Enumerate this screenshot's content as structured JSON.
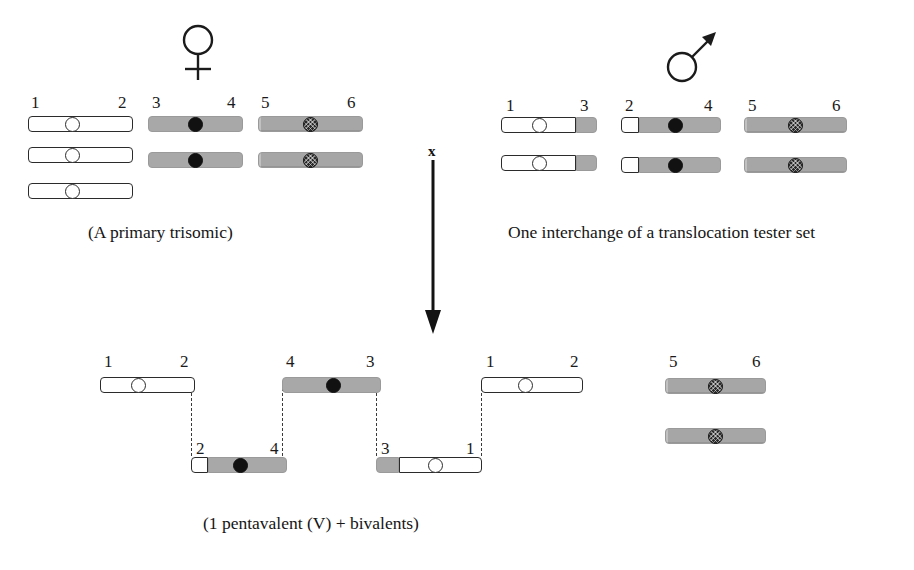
{
  "figure": {
    "cross_symbol": "x"
  },
  "parents": {
    "female": {
      "symbol_name": "female-venus-symbol",
      "caption": "(A primary trisomic)",
      "groups": [
        {
          "name": "chromosome-1-2",
          "labels": {
            "left": "1",
            "right": "2"
          },
          "copies": 3,
          "segments": [
            {
              "type": "white",
              "pct": 100
            }
          ],
          "centromere": {
            "style": "open",
            "pos_pct": 42
          }
        },
        {
          "name": "chromosome-3-4",
          "labels": {
            "left": "3",
            "right": "4"
          },
          "copies": 2,
          "segments": [
            {
              "type": "grey",
              "pct": 100
            }
          ],
          "centromere": {
            "style": "solid",
            "pos_pct": 50
          }
        },
        {
          "name": "chromosome-5-6",
          "labels": {
            "left": "5",
            "right": "6"
          },
          "copies": 2,
          "segments": [
            {
              "type": "grey-tex",
              "pct": 100
            }
          ],
          "centromere": {
            "style": "hatch",
            "pos_pct": 50
          }
        }
      ]
    },
    "male": {
      "symbol_name": "male-mars-symbol",
      "caption": "One interchange of a translocation tester set",
      "groups": [
        {
          "name": "chromosome-1-3",
          "labels": {
            "left": "1",
            "right": "3"
          },
          "copies": 2,
          "segments": [
            {
              "type": "white",
              "pct": 78
            },
            {
              "type": "grey",
              "pct": 22
            }
          ],
          "centromere": {
            "style": "open",
            "pos_pct": 40
          }
        },
        {
          "name": "chromosome-2-4",
          "labels": {
            "left": "2",
            "right": "4"
          },
          "copies": 2,
          "segments": [
            {
              "type": "white",
              "pct": 18
            },
            {
              "type": "grey",
              "pct": 82
            }
          ],
          "centromere": {
            "style": "solid",
            "pos_pct": 54
          }
        },
        {
          "name": "chromosome-5-6",
          "labels": {
            "left": "5",
            "right": "6"
          },
          "copies": 2,
          "segments": [
            {
              "type": "grey-tex",
              "pct": 100
            }
          ],
          "centromere": {
            "style": "hatch",
            "pos_pct": 50
          }
        }
      ]
    }
  },
  "progeny": {
    "caption": "(1 pentavalent (V) + bivalents)",
    "pentavalent": [
      {
        "name": "pentavalent-chromosome-1-2",
        "labels": {
          "left": "1",
          "right": "2"
        },
        "row": "upper",
        "segments": [
          {
            "type": "white",
            "pct": 100
          }
        ],
        "centromere": {
          "style": "open",
          "pos_pct": 40
        }
      },
      {
        "name": "pentavalent-chromosome-2-4",
        "labels": {
          "left": "2",
          "right": "4"
        },
        "row": "lower",
        "segments": [
          {
            "type": "white",
            "pct": 18
          },
          {
            "type": "grey",
            "pct": 82
          }
        ],
        "centromere": {
          "style": "solid",
          "pos_pct": 52
        }
      },
      {
        "name": "pentavalent-chromosome-4-3",
        "labels": {
          "left": "4",
          "right": "3"
        },
        "row": "upper",
        "segments": [
          {
            "type": "grey",
            "pct": 100
          }
        ],
        "centromere": {
          "style": "solid",
          "pos_pct": 52
        }
      },
      {
        "name": "pentavalent-chromosome-3-1",
        "labels": {
          "left": "3",
          "right": "1"
        },
        "row": "lower",
        "segments": [
          {
            "type": "grey",
            "pct": 22
          },
          {
            "type": "white",
            "pct": 78
          }
        ],
        "centromere": {
          "style": "open",
          "pos_pct": 56
        }
      },
      {
        "name": "pentavalent-chromosome-1-2-right",
        "labels": {
          "left": "1",
          "right": "2"
        },
        "row": "upper",
        "segments": [
          {
            "type": "white",
            "pct": 100
          }
        ],
        "centromere": {
          "style": "open",
          "pos_pct": 44
        }
      }
    ],
    "bivalent": {
      "name": "bivalent-chromosome-5-6",
      "labels": {
        "left": "5",
        "right": "6"
      },
      "copies": 2,
      "segments": [
        {
          "type": "grey-tex",
          "pct": 100
        }
      ],
      "centromere": {
        "style": "hatch",
        "pos_pct": 50
      }
    }
  }
}
